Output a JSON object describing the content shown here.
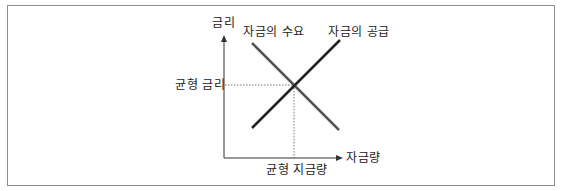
{
  "diagram": {
    "type": "supply-demand",
    "axes": {
      "y_label": "금리",
      "x_label": "자금량"
    },
    "curves": {
      "demand_label": "자금의 수요",
      "supply_label": "자금의 공급"
    },
    "equilibrium": {
      "rate_label": "균형 금리",
      "quantity_label": "균형 지금량"
    },
    "colors": {
      "border": "#8c8c8c",
      "axis": "#333333",
      "demand_line": "#555555",
      "supply_line": "#222222",
      "guide_line": "#777777"
    }
  }
}
